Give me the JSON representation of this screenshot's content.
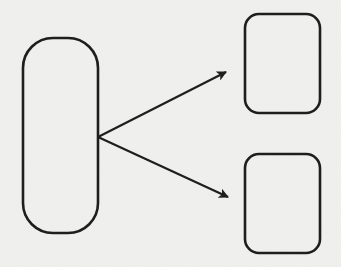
{
  "diagram": {
    "background": "#f1f1ef",
    "stroke_color": "#1e1e1e",
    "nodes": [
      {
        "id": "source",
        "shape": "pill",
        "label": "",
        "x": 23,
        "y": 38,
        "width": 75,
        "height": 195,
        "radius": 30
      },
      {
        "id": "target-top",
        "shape": "rounded-rect",
        "label": "",
        "x": 245,
        "y": 14,
        "width": 75,
        "height": 99,
        "radius": 14
      },
      {
        "id": "target-bottom",
        "shape": "rounded-rect",
        "label": "",
        "x": 245,
        "y": 154,
        "width": 75,
        "height": 99,
        "radius": 14
      }
    ],
    "edges": [
      {
        "from": "source",
        "to": "target-top",
        "x1": 98,
        "y1": 137,
        "x2": 226,
        "y2": 72
      },
      {
        "from": "source",
        "to": "target-bottom",
        "x1": 98,
        "y1": 137,
        "x2": 228,
        "y2": 197
      }
    ]
  }
}
